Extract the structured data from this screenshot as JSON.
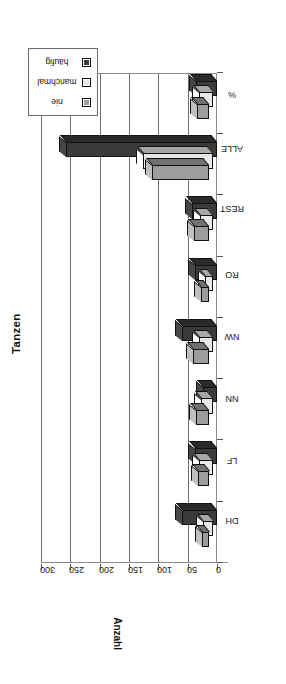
{
  "chart_data": {
    "type": "bar",
    "title": "Tanzen",
    "xlabel": "",
    "ylabel": "Anzahl",
    "categories": [
      "DH",
      "LF",
      "NN",
      "NW",
      "RO",
      "REST",
      "ALLE",
      "%"
    ],
    "ylim": [
      0,
      300
    ],
    "yticks": [
      0,
      50,
      100,
      150,
      200,
      250,
      300
    ],
    "grid": true,
    "legend_position": "top-right",
    "orientation": "rotated-90-ccw",
    "series": [
      {
        "name": "nie",
        "color": "#9d9d9d",
        "values": [
          13,
          20,
          22,
          28,
          14,
          26,
          98,
          21
        ]
      },
      {
        "name": "manchmal",
        "color": "#e8e8e8",
        "values": [
          18,
          24,
          20,
          24,
          14,
          23,
          120,
          25
        ]
      },
      {
        "name": "häufig",
        "color": "#3a3a3a",
        "values": [
          60,
          37,
          24,
          60,
          38,
          42,
          258,
          36
        ]
      }
    ]
  },
  "legend": {
    "items": [
      {
        "label": "nie"
      },
      {
        "label": "manchmal"
      },
      {
        "label": "häufig"
      }
    ]
  },
  "axes": {
    "value_axis_title": "Anzahl",
    "value_ticks": [
      "300",
      "250",
      "200",
      "150",
      "100",
      "50",
      "0"
    ],
    "category_labels": [
      "DH",
      "LF",
      "NN",
      "NW",
      "RO",
      "REST",
      "ALLE",
      "%"
    ]
  },
  "title": {
    "text": "Tanzen"
  },
  "colors": {
    "nie": "#9d9d9d",
    "manchmal": "#e8e8e8",
    "haeufig": "#3a3a3a",
    "frame": "#8a8a8a",
    "gridline": "#6f6f6f",
    "text": "#111111"
  }
}
